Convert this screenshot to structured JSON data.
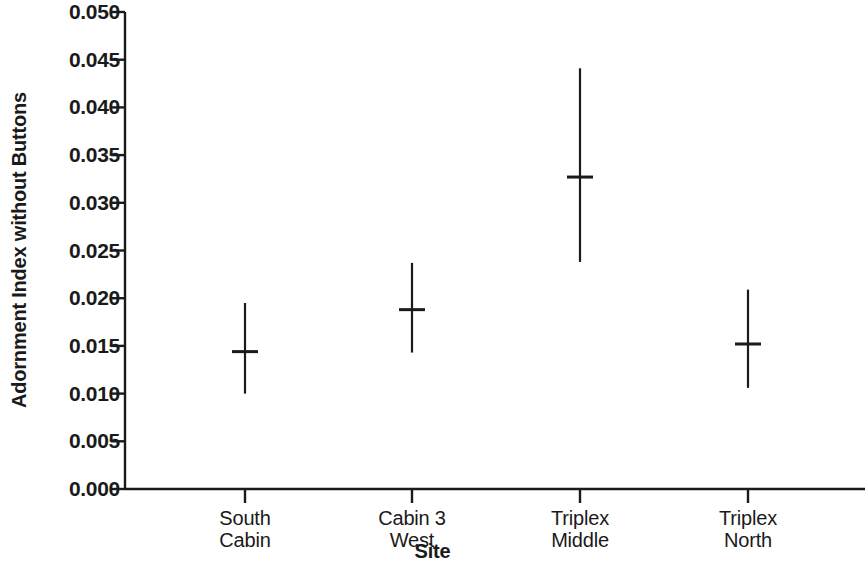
{
  "chart_data": {
    "type": "scatter",
    "title": "",
    "subtitle": "",
    "xlabel": "Site",
    "ylabel": "Adornment Index without Buttons",
    "categories": [
      "South\nCabin",
      "Cabin 3\nWest",
      "Triplex\nMiddle",
      "Triplex\nNorth"
    ],
    "category_lines": [
      [
        "South",
        "Cabin"
      ],
      [
        "Cabin 3",
        "West"
      ],
      [
        "Triplex",
        "Middle"
      ],
      [
        "Triplex",
        "North"
      ]
    ],
    "values": [
      0.0144,
      0.0188,
      0.0327,
      0.0152
    ],
    "error_low": [
      0.01,
      0.0143,
      0.0238,
      0.0106
    ],
    "error_high": [
      0.0195,
      0.0237,
      0.0441,
      0.0209
    ],
    "ylim": [
      0.0,
      0.05
    ],
    "ytick_values": [
      0.0,
      0.005,
      0.01,
      0.015,
      0.02,
      0.025,
      0.03,
      0.035,
      0.04,
      0.045,
      0.05
    ],
    "ytick_labels": [
      "0.000",
      "0.005",
      "0.010",
      "0.015",
      "0.020",
      "0.025",
      "0.030",
      "0.035",
      "0.040",
      "0.045",
      "0.050"
    ],
    "grid": false,
    "legend": null,
    "marker": "mean-tick-with-range-bar",
    "series_color": "#1a1a1a",
    "axis_color": "#1a1a1a"
  }
}
